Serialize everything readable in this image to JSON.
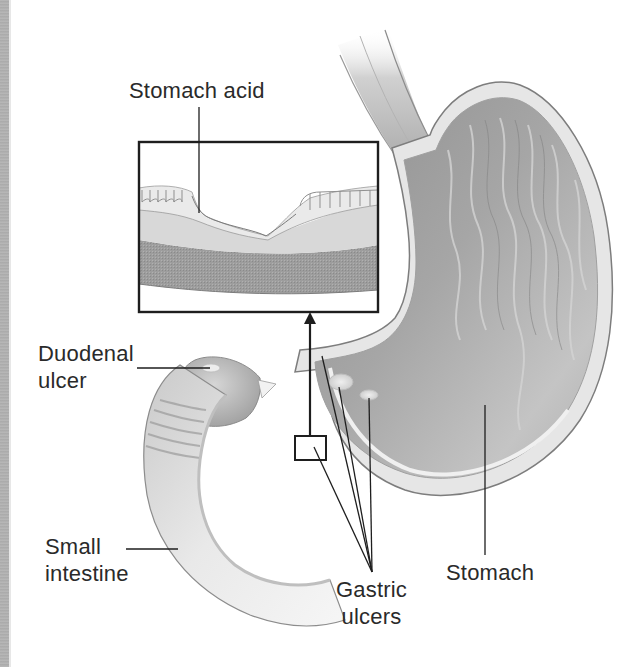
{
  "figure": {
    "inset": "Magnified view of ulcer in stomach lining"
  },
  "labels": {
    "stomach_acid": "Stomach acid",
    "duodenal_ulcer": [
      "Duodenal",
      "ulcer"
    ],
    "small_intestine": [
      "Small",
      "intestine"
    ],
    "gastric_ulcers": [
      "Gastric",
      "ulcers"
    ],
    "stomach": "Stomach"
  },
  "colors": {
    "background": "#ffffff",
    "text": "#2a2a2a",
    "leader_line": "#1e1e1e",
    "tissue_light": "#e4e4e4",
    "tissue_mid": "#b9b9b9",
    "tissue_dark": "#8e8e8e",
    "left_strip": "#aaaaaa"
  }
}
